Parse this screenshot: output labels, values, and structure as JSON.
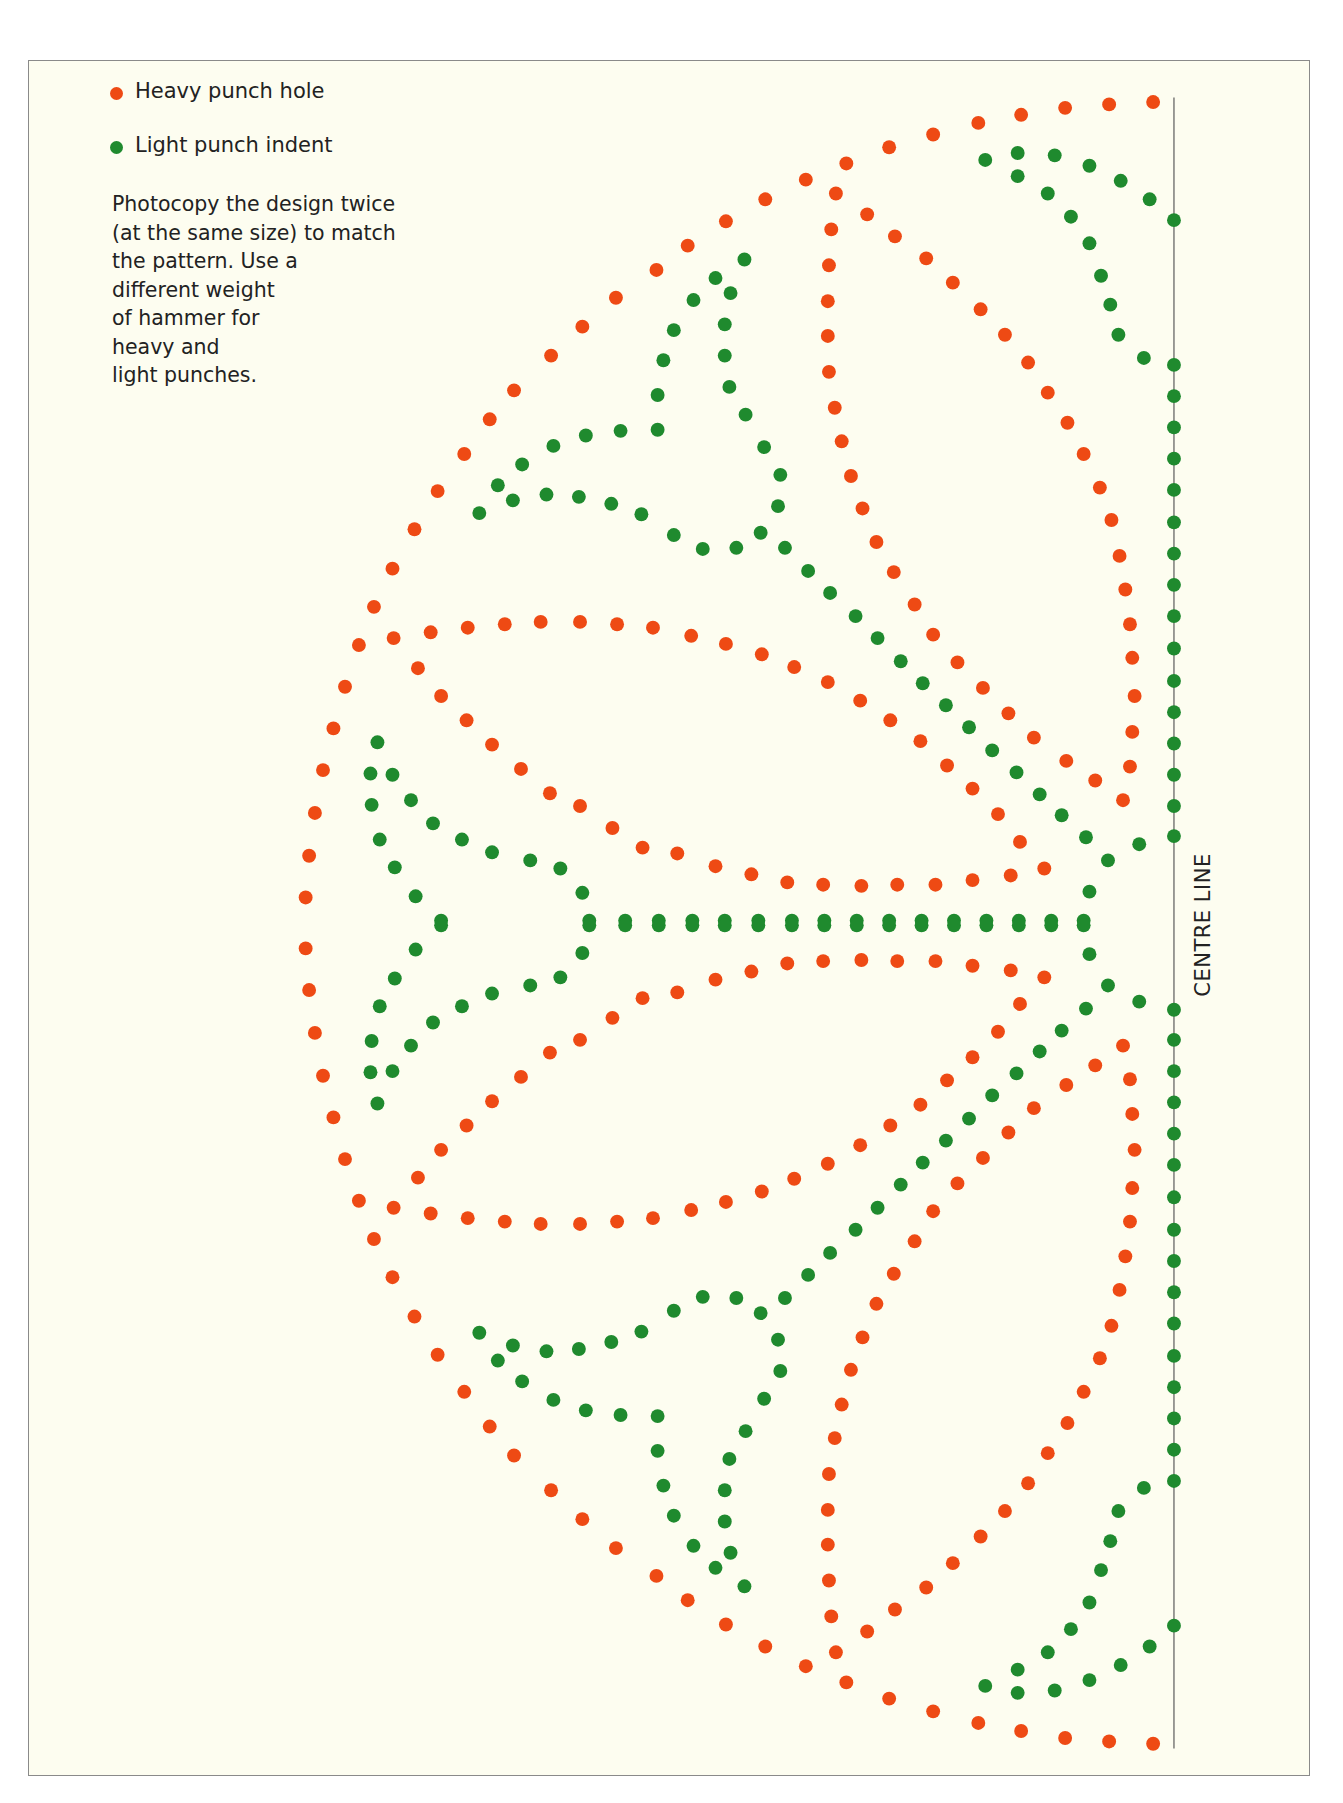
{
  "legend": {
    "items": [
      {
        "label": "Heavy punch hole",
        "color": "#ee4a14",
        "icon": "red-dot-icon"
      },
      {
        "label": "Light punch indent",
        "color": "#1f8a2e",
        "icon": "green-dot-icon"
      }
    ]
  },
  "instructions": "Photocopy the design twice\n(at the same size) to match\nthe pattern. Use a\ndifferent weight\nof hammer for\nheavy and\nlight punches.",
  "centre_line": {
    "label": "CENTRE LINE"
  },
  "colors": {
    "heavy": "#ee4a14",
    "light": "#1f8a2e",
    "background": "#fdfdf0",
    "frame": "#8a8a8a",
    "line": "#555555"
  },
  "pattern": {
    "description": "Half of a symmetric punched-tin design: dotted red (heavy) and green (light) curves radiating from the centre line",
    "heavy_top": [
      [
        996,
        88
      ],
      [
        958,
        90
      ],
      [
        920,
        93
      ],
      [
        882,
        99
      ],
      [
        845,
        106
      ],
      [
        806,
        116
      ],
      [
        768,
        127
      ],
      [
        731,
        141
      ],
      [
        696,
        155
      ],
      [
        661,
        172
      ],
      [
        627,
        191
      ],
      [
        594,
        212
      ],
      [
        567,
        233
      ],
      [
        532,
        257
      ],
      [
        503,
        282
      ],
      [
        476,
        307
      ],
      [
        444,
        337
      ],
      [
        423,
        362
      ],
      [
        401,
        392
      ],
      [
        378,
        424
      ],
      [
        358,
        457
      ],
      [
        339,
        491
      ],
      [
        323,
        524
      ],
      [
        310,
        557
      ],
      [
        298,
        593
      ],
      [
        288,
        629
      ],
      [
        279,
        665
      ],
      [
        272,
        702
      ],
      [
        267,
        739
      ],
      [
        264,
        775
      ],
      [
        722,
        167
      ],
      [
        749,
        185
      ],
      [
        773,
        204
      ],
      [
        800,
        223
      ],
      [
        823,
        244
      ],
      [
        847,
        267
      ],
      [
        868,
        289
      ],
      [
        888,
        313
      ],
      [
        905,
        339
      ],
      [
        922,
        365
      ],
      [
        936,
        392
      ],
      [
        950,
        421
      ],
      [
        960,
        449
      ],
      [
        967,
        480
      ],
      [
        972,
        509
      ],
      [
        976,
        539
      ],
      [
        978,
        568
      ],
      [
        980,
        601
      ],
      [
        978,
        632
      ],
      [
        976,
        662
      ],
      [
        970,
        691
      ],
      [
        718,
        198
      ],
      [
        716,
        229
      ],
      [
        715,
        260
      ],
      [
        715,
        290
      ],
      [
        716,
        321
      ],
      [
        721,
        352
      ],
      [
        727,
        381
      ],
      [
        735,
        411
      ],
      [
        745,
        439
      ],
      [
        757,
        468
      ],
      [
        772,
        494
      ],
      [
        790,
        522
      ],
      [
        806,
        548
      ],
      [
        827,
        572
      ],
      [
        849,
        594
      ],
      [
        871,
        616
      ],
      [
        893,
        637
      ],
      [
        921,
        657
      ],
      [
        946,
        674
      ],
      [
        340,
        551
      ],
      [
        372,
        546
      ],
      [
        404,
        542
      ],
      [
        436,
        539
      ],
      [
        467,
        537
      ],
      [
        501,
        537
      ],
      [
        533,
        539
      ],
      [
        564,
        542
      ],
      [
        597,
        549
      ],
      [
        627,
        556
      ],
      [
        658,
        565
      ],
      [
        686,
        576
      ],
      [
        715,
        589
      ],
      [
        743,
        605
      ],
      [
        769,
        622
      ],
      [
        795,
        640
      ],
      [
        818,
        661
      ],
      [
        840,
        681
      ],
      [
        862,
        703
      ],
      [
        881,
        727
      ],
      [
        902,
        750
      ],
      [
        361,
        577
      ],
      [
        381,
        601
      ],
      [
        403,
        622
      ],
      [
        425,
        643
      ],
      [
        450,
        664
      ],
      [
        475,
        685
      ],
      [
        501,
        696
      ],
      [
        529,
        715
      ],
      [
        555,
        732
      ],
      [
        585,
        737
      ],
      [
        618,
        748
      ],
      [
        649,
        755
      ],
      [
        680,
        762
      ],
      [
        711,
        764
      ],
      [
        744,
        765
      ],
      [
        775,
        764
      ],
      [
        808,
        764
      ],
      [
        840,
        760
      ],
      [
        873,
        756
      ]
    ],
    "light_top": [
      [
        1014,
        190
      ],
      [
        993,
        172
      ],
      [
        968,
        156
      ],
      [
        941,
        143
      ],
      [
        911,
        134
      ],
      [
        879,
        132
      ],
      [
        851,
        138
      ],
      [
        879,
        152
      ],
      [
        905,
        167
      ],
      [
        925,
        187
      ],
      [
        941,
        210
      ],
      [
        951,
        238
      ],
      [
        959,
        263
      ],
      [
        966,
        289
      ],
      [
        988,
        309
      ],
      [
        1014,
        315
      ],
      [
        1014,
        342
      ],
      [
        1014,
        369
      ],
      [
        1014,
        396
      ],
      [
        1014,
        423
      ],
      [
        1014,
        451
      ],
      [
        1014,
        478
      ],
      [
        1014,
        505
      ],
      [
        1014,
        532
      ],
      [
        1014,
        560
      ],
      [
        1014,
        588
      ],
      [
        1014,
        615
      ],
      [
        1014,
        642
      ],
      [
        1014,
        669
      ],
      [
        1014,
        696
      ],
      [
        1014,
        722
      ],
      [
        643,
        224
      ],
      [
        631,
        253
      ],
      [
        626,
        280
      ],
      [
        626,
        307
      ],
      [
        630,
        334
      ],
      [
        644,
        358
      ],
      [
        660,
        386
      ],
      [
        674,
        410
      ],
      [
        672,
        437
      ],
      [
        657,
        460
      ],
      [
        636,
        473
      ],
      [
        607,
        474
      ],
      [
        582,
        462
      ],
      [
        618,
        240
      ],
      [
        599,
        259
      ],
      [
        582,
        285
      ],
      [
        573,
        311
      ],
      [
        568,
        341
      ],
      [
        568,
        371
      ],
      [
        536,
        372
      ],
      [
        506,
        376
      ],
      [
        478,
        385
      ],
      [
        451,
        401
      ],
      [
        430,
        419
      ],
      [
        414,
        443
      ],
      [
        443,
        432
      ],
      [
        472,
        427
      ],
      [
        500,
        429
      ],
      [
        528,
        435
      ],
      [
        554,
        444
      ],
      [
        678,
        473
      ],
      [
        698,
        493
      ],
      [
        717,
        512
      ],
      [
        739,
        532
      ],
      [
        758,
        551
      ],
      [
        778,
        571
      ],
      [
        797,
        590
      ],
      [
        817,
        609
      ],
      [
        837,
        628
      ],
      [
        857,
        648
      ],
      [
        878,
        667
      ],
      [
        898,
        686
      ],
      [
        917,
        704
      ],
      [
        938,
        723
      ],
      [
        957,
        743
      ],
      [
        984,
        729
      ],
      [
        326,
        641
      ],
      [
        320,
        668
      ],
      [
        339,
        669
      ],
      [
        321,
        695
      ],
      [
        355,
        691
      ],
      [
        328,
        725
      ],
      [
        374,
        711
      ],
      [
        341,
        749
      ],
      [
        399,
        725
      ],
      [
        359,
        774
      ],
      [
        425,
        736
      ],
      [
        458,
        743
      ],
      [
        484,
        750
      ],
      [
        503,
        771
      ],
      [
        381,
        795
      ],
      [
        509,
        795
      ],
      [
        540,
        795
      ],
      [
        569,
        795
      ],
      [
        598,
        795
      ],
      [
        626,
        795
      ],
      [
        655,
        795
      ],
      [
        684,
        795
      ],
      [
        712,
        795
      ],
      [
        740,
        795
      ],
      [
        768,
        795
      ],
      [
        796,
        795
      ],
      [
        824,
        795
      ],
      [
        852,
        795
      ],
      [
        880,
        795
      ],
      [
        908,
        795
      ],
      [
        936,
        795
      ],
      [
        941,
        770
      ]
    ],
    "axis_y": 797
  }
}
